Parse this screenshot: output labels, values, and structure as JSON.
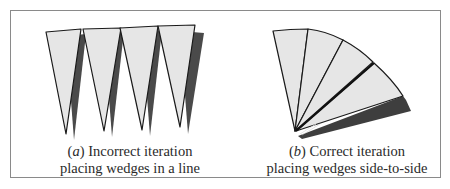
{
  "figure": {
    "panel_a": {
      "label": "a",
      "caption_line1": "Incorrect iteration",
      "caption_line2": "placing wedges in a line",
      "wedge_count": 4
    },
    "panel_b": {
      "label": "b",
      "caption_line1": "Correct iteration",
      "caption_line2": "placing wedges side-to-side",
      "wedge_count": 4
    },
    "colors": {
      "wedge_fill": "#e6e6e6",
      "wedge_stroke": "#1a1a1a",
      "shadow": "#4a4a4a",
      "border": "#8a8a8a"
    }
  }
}
